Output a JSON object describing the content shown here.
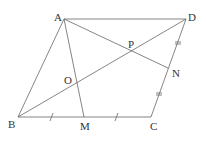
{
  "diagram": {
    "type": "parallelogram-geometry",
    "points": {
      "A": {
        "label": "A",
        "x": 64,
        "y": 19
      },
      "D": {
        "label": "D",
        "x": 186,
        "y": 19
      },
      "B": {
        "label": "B",
        "x": 18,
        "y": 117
      },
      "C": {
        "label": "C",
        "x": 151,
        "y": 117
      },
      "M": {
        "label": "M",
        "x": 84,
        "y": 117
      },
      "N": {
        "label": "N",
        "x": 168,
        "y": 68
      },
      "P": {
        "label": "P",
        "x": 133,
        "y": 50
      },
      "O": {
        "label": "O",
        "x": 77,
        "y": 82
      }
    },
    "segments": [
      "AD",
      "AB",
      "BC",
      "CD",
      "BD",
      "AM",
      "AN"
    ],
    "tick_marks": {
      "BM_MC": "single",
      "DN_NC": "double"
    }
  }
}
